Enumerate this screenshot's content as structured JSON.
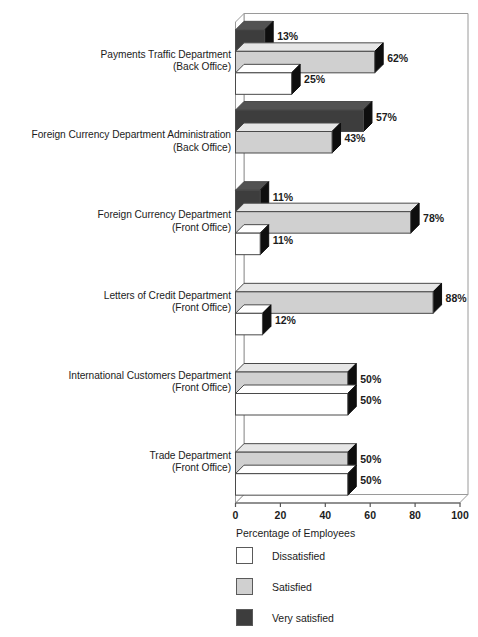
{
  "chart_data": {
    "type": "bar",
    "orientation": "horizontal",
    "style": "3d-grouped-bar",
    "title": "",
    "xlabel": "Percentage of Employees",
    "ylabel": "",
    "xlim": [
      0,
      100
    ],
    "xticks": [
      0,
      20,
      40,
      60,
      80,
      100
    ],
    "xtick_labels": [
      "0",
      "20",
      "40",
      "60",
      "80",
      "100"
    ],
    "grid": false,
    "legend_position": "below-axis-left",
    "value_label_suffix": "%",
    "categories": [
      "Payments Traffic Department\n(Back Office)",
      "Foreign Currency Department Administration\n(Back Office)",
      "Foreign Currency Department\n(Front Office)",
      "Letters of Credit Department\n(Front Office)",
      "International Customers Department\n(Front Office)",
      "Trade Department\n(Front Office)"
    ],
    "category_lines": [
      [
        "Payments Traffic Department",
        "(Back Office)"
      ],
      [
        "Foreign Currency Department Administration",
        "(Back Office)"
      ],
      [
        "Foreign Currency Department",
        "(Front Office)"
      ],
      [
        "Letters of Credit Department",
        "(Front Office)"
      ],
      [
        "International Customers Department",
        "(Front Office)"
      ],
      [
        "Trade Department",
        "(Front Office)"
      ]
    ],
    "series": [
      {
        "name": "Very satisfied",
        "color": "#3d3d3d",
        "values": [
          13,
          57,
          11,
          0,
          0,
          0
        ],
        "labels": [
          "13%",
          "57%",
          "11%",
          "",
          "",
          ""
        ]
      },
      {
        "name": "Satisfied",
        "color": "#d0d0d0",
        "values": [
          62,
          43,
          78,
          88,
          50,
          50
        ],
        "labels": [
          "62%",
          "43%",
          "78%",
          "88%",
          "50%",
          "50%"
        ]
      },
      {
        "name": "Dissatisfied",
        "color": "#ffffff",
        "values": [
          25,
          0,
          11,
          12,
          50,
          50
        ],
        "labels": [
          "25%",
          "",
          "11%",
          "12%",
          "50%",
          "50%"
        ]
      }
    ]
  },
  "legend": {
    "items": [
      {
        "label": "Dissatisfied",
        "color": "#ffffff"
      },
      {
        "label": "Satisfied",
        "color": "#d0d0d0"
      },
      {
        "label": "Very satisfied",
        "color": "#3d3d3d"
      }
    ]
  },
  "axis": {
    "title": "Percentage of Employees",
    "ticks": [
      "0",
      "20",
      "40",
      "60",
      "80",
      "100"
    ]
  },
  "colors": {
    "very_satisfied": "#3d3d3d",
    "satisfied": "#d0d0d0",
    "dissatisfied": "#ffffff",
    "side_face": "#0e0e0e",
    "outline": "#4a4a4a",
    "frame": "#9a9a9a",
    "text": "#1c1c1c"
  }
}
